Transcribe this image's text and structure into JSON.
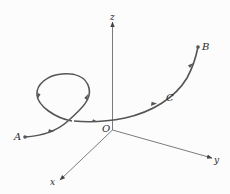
{
  "diagram": {
    "axes": {
      "x_label": "x",
      "y_label": "y",
      "z_label": "z",
      "origin_label": "O"
    },
    "points": {
      "start_label": "A",
      "end_label": "B",
      "mid_label": "C"
    },
    "colors": {
      "path": "#555555",
      "axes": "#444444",
      "text": "#2a2a2a"
    }
  }
}
